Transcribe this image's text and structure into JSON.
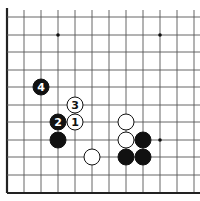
{
  "diagram": {
    "type": "go-board-partial",
    "grid": {
      "columns_x": [
        7,
        24,
        41,
        58,
        75,
        92,
        109,
        126,
        143,
        160,
        177,
        194
      ],
      "rows_y": [
        17,
        35,
        52,
        70,
        87,
        105,
        122,
        140,
        157,
        175,
        193
      ],
      "left_edge": true,
      "bottom_edge": true,
      "line_color": "#555555",
      "edge_color": "#222222"
    },
    "star_points": [
      {
        "col": 3,
        "row": 1
      },
      {
        "col": 9,
        "row": 1
      },
      {
        "col": 9,
        "row": 7
      }
    ],
    "stones": [
      {
        "color": "black",
        "col": 2,
        "row": 4,
        "label": "4"
      },
      {
        "color": "white",
        "col": 4,
        "row": 5,
        "label": "3"
      },
      {
        "color": "black",
        "col": 3,
        "row": 6,
        "label": "2"
      },
      {
        "color": "white",
        "col": 4,
        "row": 6,
        "label": "1"
      },
      {
        "color": "black",
        "col": 3,
        "row": 7,
        "label": ""
      },
      {
        "color": "white",
        "col": 5,
        "row": 8,
        "label": ""
      },
      {
        "color": "white",
        "col": 7,
        "row": 6,
        "label": ""
      },
      {
        "color": "white",
        "col": 7,
        "row": 7,
        "label": ""
      },
      {
        "color": "black",
        "col": 8,
        "row": 7,
        "label": ""
      },
      {
        "color": "black",
        "col": 7,
        "row": 8,
        "label": ""
      },
      {
        "color": "black",
        "col": 8,
        "row": 8,
        "label": ""
      }
    ],
    "colors": {
      "black_stone": "#111111",
      "white_stone": "#ffffff",
      "stone_outline": "#111111"
    }
  }
}
